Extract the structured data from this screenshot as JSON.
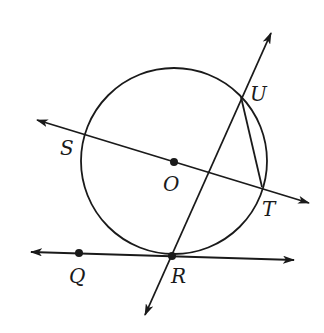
{
  "diagram": {
    "type": "geometry",
    "colors": {
      "ink": "#1a1a1a",
      "background": "#ffffff"
    },
    "circle": {
      "center_label": "O",
      "cx": 174,
      "cy": 161,
      "r": 93
    },
    "points": {
      "S": {
        "label": "S",
        "x": 84,
        "y": 134
      },
      "O": {
        "label": "O",
        "x": 174,
        "y": 162
      },
      "T": {
        "label": "T",
        "x": 262,
        "y": 187
      },
      "U": {
        "label": "U",
        "x": 241,
        "y": 97
      },
      "R": {
        "label": "R",
        "x": 172,
        "y": 256
      },
      "Q": {
        "label": "Q",
        "x": 79,
        "y": 253
      }
    },
    "lines": [
      {
        "name": "line-SOT",
        "through": [
          "S",
          "O",
          "T"
        ],
        "arrows": "both"
      },
      {
        "name": "line-UR",
        "through": [
          "U",
          "R"
        ],
        "arrows": "both"
      },
      {
        "name": "line-QR",
        "through": [
          "Q",
          "R"
        ],
        "arrows": "both",
        "tangent_at": "R"
      }
    ],
    "segments": [
      {
        "name": "chord-UT",
        "from": "U",
        "to": "T"
      }
    ]
  }
}
